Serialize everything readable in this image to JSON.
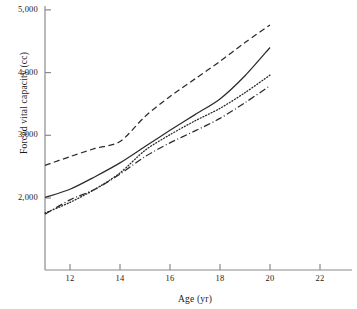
{
  "chart_data": {
    "type": "line",
    "title": "",
    "xlabel": "Age (yr)",
    "ylabel": "Forced vital capacity (cc)",
    "xlim": [
      11,
      22
    ],
    "ylim": [
      1500,
      5000
    ],
    "grid": false,
    "legend": "none",
    "xticks": [
      12,
      14,
      16,
      18,
      20,
      22
    ],
    "xtick_labels": [
      "12",
      "14",
      "16",
      "18",
      "20",
      "22"
    ],
    "yticks": [
      2000,
      3000,
      4000,
      5000
    ],
    "ytick_labels": [
      "2,000",
      "3,000",
      "4,000",
      "5,000"
    ],
    "x": [
      11,
      12,
      13,
      14,
      15,
      16,
      17,
      18,
      19,
      20
    ],
    "series": [
      {
        "name": "series-1",
        "style": "dashed",
        "color": "#2b2b2b",
        "values": [
          2520,
          2660,
          2790,
          2900,
          3300,
          3620,
          3900,
          4180,
          4480,
          4760
        ]
      },
      {
        "name": "series-2",
        "style": "solid",
        "color": "#2b2b2b",
        "values": [
          2010,
          2140,
          2340,
          2560,
          2820,
          3080,
          3330,
          3580,
          3950,
          4400
        ]
      },
      {
        "name": "series-3",
        "style": "dotted",
        "color": "#2b2b2b",
        "values": [
          1760,
          1930,
          2140,
          2400,
          2760,
          3010,
          3230,
          3430,
          3680,
          3960
        ]
      },
      {
        "name": "series-4",
        "style": "dashdot",
        "color": "#2b2b2b",
        "values": [
          1740,
          1970,
          2140,
          2380,
          2660,
          2880,
          3070,
          3270,
          3520,
          3790
        ]
      }
    ]
  },
  "axes": {
    "axis_color": "#8a8a8a",
    "line_color": "#2b2b2b"
  }
}
